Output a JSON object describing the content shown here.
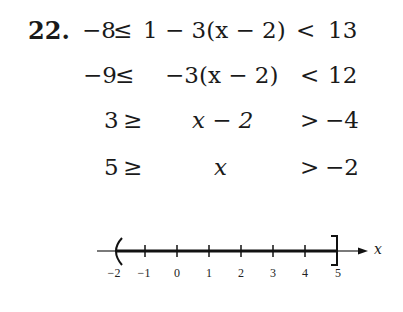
{
  "problem": {
    "number": "22.",
    "steps": [
      {
        "left": "−8",
        "op1": "≤",
        "middle": "1 − 3(x − 2)",
        "op2": "<",
        "right": "13"
      },
      {
        "left": "−9",
        "op1": "≤",
        "middle": "−3(x − 2)",
        "op2": "<",
        "right": "12"
      },
      {
        "left": "3",
        "op1": "≥",
        "middle": "x − 2",
        "op2": ">",
        "right": "−4"
      },
      {
        "left": "5",
        "op1": "≥",
        "middle": "x",
        "op2": ">",
        "right": "−2"
      }
    ]
  },
  "number_line": {
    "axis_label": "x",
    "ticks": [
      "−2",
      "−1",
      "0",
      "1",
      "2",
      "3",
      "4",
      "5"
    ],
    "open_endpoint": {
      "value": "−2",
      "symbol": "("
    },
    "closed_endpoint": {
      "value": "5",
      "symbol": "]"
    },
    "interval": "(−2, 5]"
  }
}
